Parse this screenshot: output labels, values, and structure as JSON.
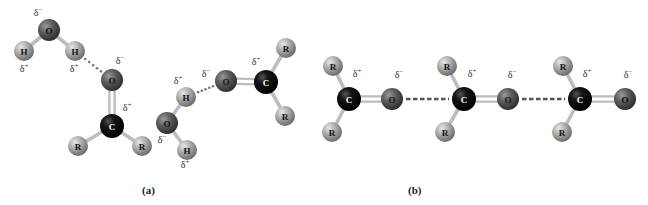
{
  "figure": {
    "panels": [
      {
        "id": "a",
        "label": "(a)",
        "label_x": 142,
        "label_y": 192
      },
      {
        "id": "b",
        "label": "(b)",
        "label_x": 408,
        "label_y": 192
      }
    ],
    "colors": {
      "oxygen": "#5c5c5c",
      "carbon": "#121212",
      "hydrogen": "#a9a9a9",
      "r_group": "#a9a9a9",
      "bond": "#bdbdbd",
      "hbond_dots": "#777777",
      "charge_text": "#333333",
      "atom_label_dark": "#111111",
      "atom_label_light": "#ffffff"
    },
    "atoms": [
      {
        "id": "a_w1_O",
        "el": "O",
        "label": "O",
        "x": 49,
        "y": 30,
        "r": 11
      },
      {
        "id": "a_w1_H1",
        "el": "H",
        "label": "H",
        "x": 24,
        "y": 51,
        "r": 10
      },
      {
        "id": "a_w1_H2",
        "el": "H",
        "label": "H",
        "x": 75,
        "y": 51,
        "r": 10
      },
      {
        "id": "a_c1_O",
        "el": "O",
        "label": "O",
        "x": 112,
        "y": 80,
        "r": 11
      },
      {
        "id": "a_c1_C",
        "el": "C",
        "label": "C",
        "x": 112,
        "y": 126,
        "r": 12
      },
      {
        "id": "a_c1_R1",
        "el": "R",
        "label": "R",
        "x": 78,
        "y": 146,
        "r": 10
      },
      {
        "id": "a_c1_R2",
        "el": "R",
        "label": "R",
        "x": 142,
        "y": 146,
        "r": 10
      },
      {
        "id": "a_w2_H1",
        "el": "H",
        "label": "H",
        "x": 186,
        "y": 97,
        "r": 10
      },
      {
        "id": "a_w2_O",
        "el": "O",
        "label": "O",
        "x": 167,
        "y": 123,
        "r": 11
      },
      {
        "id": "a_w2_H2",
        "el": "H",
        "label": "H",
        "x": 187,
        "y": 150,
        "r": 10
      },
      {
        "id": "a_c2_O",
        "el": "O",
        "label": "O",
        "x": 226,
        "y": 81,
        "r": 11
      },
      {
        "id": "a_c2_C",
        "el": "C",
        "label": "C",
        "x": 266,
        "y": 82,
        "r": 12
      },
      {
        "id": "a_c2_R1",
        "el": "R",
        "label": "R",
        "x": 286,
        "y": 48,
        "r": 10
      },
      {
        "id": "a_c2_R2",
        "el": "R",
        "label": "R",
        "x": 285,
        "y": 116,
        "r": 10
      },
      {
        "id": "b_m1_R1",
        "el": "R",
        "label": "R",
        "x": 333,
        "y": 66,
        "r": 10
      },
      {
        "id": "b_m1_C",
        "el": "C",
        "label": "C",
        "x": 349,
        "y": 99,
        "r": 12
      },
      {
        "id": "b_m1_O",
        "el": "O",
        "label": "O",
        "x": 392,
        "y": 99,
        "r": 11
      },
      {
        "id": "b_m1_R2",
        "el": "R",
        "label": "R",
        "x": 332,
        "y": 132,
        "r": 10
      },
      {
        "id": "b_m2_R1",
        "el": "R",
        "label": "R",
        "x": 447,
        "y": 66,
        "r": 10
      },
      {
        "id": "b_m2_C",
        "el": "C",
        "label": "C",
        "x": 464,
        "y": 99,
        "r": 12
      },
      {
        "id": "b_m2_O",
        "el": "O",
        "label": "O",
        "x": 508,
        "y": 99,
        "r": 11
      },
      {
        "id": "b_m2_R2",
        "el": "R",
        "label": "R",
        "x": 445,
        "y": 132,
        "r": 10
      },
      {
        "id": "b_m3_R1",
        "el": "R",
        "label": "R",
        "x": 563,
        "y": 66,
        "r": 10
      },
      {
        "id": "b_m3_C",
        "el": "C",
        "label": "C",
        "x": 580,
        "y": 99,
        "r": 12
      },
      {
        "id": "b_m3_O",
        "el": "O",
        "label": "O",
        "x": 625,
        "y": 99,
        "r": 11
      },
      {
        "id": "b_m3_R2",
        "el": "R",
        "label": "R",
        "x": 562,
        "y": 132,
        "r": 10
      }
    ],
    "bonds": [
      {
        "a": "a_w1_O",
        "b": "a_w1_H1",
        "order": 1
      },
      {
        "a": "a_w1_O",
        "b": "a_w1_H2",
        "order": 1
      },
      {
        "a": "a_c1_O",
        "b": "a_c1_C",
        "order": 2
      },
      {
        "a": "a_c1_C",
        "b": "a_c1_R1",
        "order": 1
      },
      {
        "a": "a_c1_C",
        "b": "a_c1_R2",
        "order": 1
      },
      {
        "a": "a_w2_O",
        "b": "a_w2_H1",
        "order": 1
      },
      {
        "a": "a_w2_O",
        "b": "a_w2_H2",
        "order": 1
      },
      {
        "a": "a_c2_O",
        "b": "a_c2_C",
        "order": 2
      },
      {
        "a": "a_c2_C",
        "b": "a_c2_R1",
        "order": 1
      },
      {
        "a": "a_c2_C",
        "b": "a_c2_R2",
        "order": 1
      },
      {
        "a": "b_m1_C",
        "b": "b_m1_O",
        "order": 2
      },
      {
        "a": "b_m1_C",
        "b": "b_m1_R1",
        "order": 1
      },
      {
        "a": "b_m1_C",
        "b": "b_m1_R2",
        "order": 1
      },
      {
        "a": "b_m2_C",
        "b": "b_m2_O",
        "order": 2
      },
      {
        "a": "b_m2_C",
        "b": "b_m2_R1",
        "order": 1
      },
      {
        "a": "b_m2_C",
        "b": "b_m2_R2",
        "order": 1
      },
      {
        "a": "b_m3_C",
        "b": "b_m3_O",
        "order": 2
      },
      {
        "a": "b_m3_C",
        "b": "b_m3_R1",
        "order": 1
      },
      {
        "a": "b_m3_C",
        "b": "b_m3_R2",
        "order": 1
      }
    ],
    "interactions": [
      {
        "type": "hydrogen-bond",
        "style": "dots",
        "from": "a_w1_H2",
        "to": "a_c1_O"
      },
      {
        "type": "hydrogen-bond",
        "style": "dots",
        "from": "a_w2_H1",
        "to": "a_c2_O"
      },
      {
        "type": "dipole-dipole",
        "style": "dashes",
        "from": "b_m1_O",
        "to": "b_m2_C"
      },
      {
        "type": "dipole-dipole",
        "style": "dashes",
        "from": "b_m2_O",
        "to": "b_m3_C"
      }
    ],
    "charges": [
      {
        "text": "δ−",
        "x": 38,
        "y": 16
      },
      {
        "text": "δ+",
        "x": 24,
        "y": 72
      },
      {
        "text": "δ+",
        "x": 74,
        "y": 72
      },
      {
        "text": "δ−",
        "x": 120,
        "y": 64
      },
      {
        "text": "δ+",
        "x": 127,
        "y": 111
      },
      {
        "text": "δ+",
        "x": 178,
        "y": 84
      },
      {
        "text": "δ−",
        "x": 206,
        "y": 77
      },
      {
        "text": "δ−",
        "x": 162,
        "y": 143
      },
      {
        "text": "δ+",
        "x": 185,
        "y": 168
      },
      {
        "text": "δ+",
        "x": 256,
        "y": 65
      },
      {
        "text": "δ+",
        "x": 357,
        "y": 77
      },
      {
        "text": "δ−",
        "x": 399,
        "y": 78
      },
      {
        "text": "δ+",
        "x": 472,
        "y": 77
      },
      {
        "text": "δ−",
        "x": 512,
        "y": 78
      },
      {
        "text": "δ+",
        "x": 587,
        "y": 77
      },
      {
        "text": "δ−",
        "x": 628,
        "y": 78
      }
    ]
  }
}
